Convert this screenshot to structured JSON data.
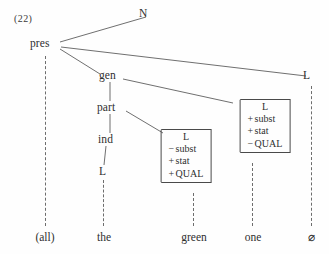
{
  "figure": {
    "example_number": "(22)",
    "type": "syntactic-tree-diagram"
  },
  "nodes": {
    "n": "N",
    "pres": "pres",
    "gen": "gen",
    "part": "part",
    "ind": "ind",
    "l_ind": "L",
    "l_right": "L"
  },
  "matrices": {
    "left": {
      "head": "L",
      "rows": [
        {
          "sign": "−",
          "feature": "subst"
        },
        {
          "sign": "+",
          "feature": "stat"
        },
        {
          "sign": "+",
          "feature": "QUAL"
        }
      ]
    },
    "right": {
      "head": "L",
      "rows": [
        {
          "sign": "+",
          "feature": "subst"
        },
        {
          "sign": "+",
          "feature": "stat"
        },
        {
          "sign": "−",
          "feature": "QUAL"
        }
      ]
    }
  },
  "terminals": [
    {
      "label": "(all)"
    },
    {
      "label": "the"
    },
    {
      "label": "green"
    },
    {
      "label": "one"
    },
    {
      "label": "⌀"
    }
  ],
  "colors": {
    "background": "#fefefe",
    "text": "#2f2f2f",
    "line": "#4a4a4a",
    "dashed_line": "#6d6d6d"
  }
}
